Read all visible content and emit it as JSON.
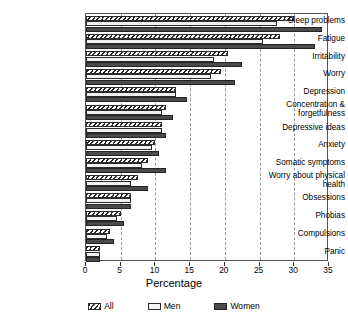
{
  "chart_data": {
    "type": "bar",
    "orientation": "horizontal",
    "title": "",
    "xlabel": "Percentage",
    "ylabel": "",
    "xlim": [
      0,
      35
    ],
    "xticks": [
      0,
      5,
      10,
      15,
      20,
      25,
      30,
      35
    ],
    "grid": "vertical-dashed",
    "legend_position": "bottom",
    "categories": [
      "Sleep problems",
      "Fatigue",
      "Irritability",
      "Worry",
      "Depression",
      "Concentration & forgetfulness",
      "Depressive ideas",
      "Anxiety",
      "Somatic symptoms",
      "Worry about physical health",
      "Obsessions",
      "Phobias",
      "Compulsions",
      "Panic"
    ],
    "series": [
      {
        "name": "All",
        "values": [
          30.0,
          28.0,
          20.5,
          19.5,
          13.0,
          11.5,
          11.0,
          10.0,
          9.0,
          7.5,
          6.5,
          5.0,
          3.5,
          2.0
        ]
      },
      {
        "name": "Men",
        "values": [
          27.5,
          25.5,
          18.5,
          18.0,
          13.0,
          11.0,
          11.0,
          9.5,
          8.0,
          6.5,
          6.5,
          4.5,
          3.0,
          2.0
        ]
      },
      {
        "name": "Women",
        "values": [
          34.0,
          33.0,
          22.5,
          21.5,
          14.5,
          12.5,
          11.5,
          10.5,
          11.5,
          9.0,
          6.5,
          5.5,
          4.0,
          2.0
        ]
      }
    ]
  },
  "legend": {
    "items": [
      {
        "label": "All",
        "swatch": "hatched"
      },
      {
        "label": "Men",
        "swatch": "light"
      },
      {
        "label": "Women",
        "swatch": "dark"
      }
    ]
  },
  "axis": {
    "x_title": "Percentage",
    "tick_labels": [
      "0",
      "5",
      "10",
      "15",
      "20",
      "25",
      "30",
      "35"
    ]
  },
  "colors": {
    "women": "#4a4a4a",
    "men": "#f2f2f2",
    "all_hatch": "#2b2b2b",
    "frame": "#555555",
    "grid": "#9a9a9a"
  }
}
